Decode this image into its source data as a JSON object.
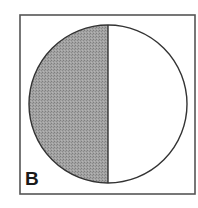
{
  "figure": {
    "panel_label": "B",
    "frame": {
      "x": 20,
      "y": 15,
      "width": 175,
      "height": 179,
      "stroke": "#555555",
      "stroke_width": 1.6
    },
    "circle": {
      "cx": 108,
      "cy": 104,
      "r": 79,
      "stroke": "#333333",
      "stroke_width": 1.4,
      "fill": "#ffffff"
    },
    "shaded_half": {
      "side": "left",
      "fill": "#9a9a9a"
    },
    "divider": {
      "x": 107,
      "stroke": "#333333",
      "stroke_width": 1.4
    }
  }
}
